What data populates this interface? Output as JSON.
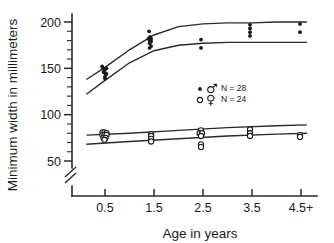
{
  "chart_data": {
    "type": "scatter",
    "title": "",
    "xlabel": "Age in years",
    "ylabel": "Minimum width in millimeters",
    "xlim": [
      0.0,
      5.0
    ],
    "ylim": [
      40,
      205
    ],
    "y_axis_break": true,
    "y_break_below": 45,
    "grid": false,
    "legend_position": "center-right",
    "x_tick_labels": [
      "0.5",
      "1.5",
      "2.5",
      "3.5",
      "4.5+"
    ],
    "x_tick_values": [
      0.5,
      1.5,
      2.5,
      3.5,
      4.5
    ],
    "y_tick_labels": [
      "200",
      "150",
      "100",
      "50"
    ],
    "y_tick_values": [
      200,
      150,
      100,
      50
    ],
    "y_minor_step": 10,
    "legend": [
      {
        "symbol": "♂",
        "marker": "filled-dot",
        "label": "N = 28"
      },
      {
        "symbol": "♀",
        "marker": "open-circle",
        "label": "N = 24"
      }
    ],
    "series": [
      {
        "name": "male",
        "marker": "filled-dot",
        "n": 28,
        "points": [
          {
            "x": 0.44,
            "y": 152
          },
          {
            "x": 0.47,
            "y": 150
          },
          {
            "x": 0.5,
            "y": 149
          },
          {
            "x": 0.53,
            "y": 150
          },
          {
            "x": 0.47,
            "y": 146
          },
          {
            "x": 0.5,
            "y": 145
          },
          {
            "x": 0.53,
            "y": 144
          },
          {
            "x": 0.5,
            "y": 141
          },
          {
            "x": 0.5,
            "y": 139
          },
          {
            "x": 1.4,
            "y": 190
          },
          {
            "x": 1.42,
            "y": 184
          },
          {
            "x": 1.39,
            "y": 182
          },
          {
            "x": 1.44,
            "y": 182
          },
          {
            "x": 1.41,
            "y": 180
          },
          {
            "x": 1.44,
            "y": 179
          },
          {
            "x": 1.41,
            "y": 177
          },
          {
            "x": 1.44,
            "y": 174
          },
          {
            "x": 1.41,
            "y": 172
          },
          {
            "x": 2.46,
            "y": 181
          },
          {
            "x": 2.46,
            "y": 172
          },
          {
            "x": 3.46,
            "y": 197
          },
          {
            "x": 3.46,
            "y": 193
          },
          {
            "x": 3.46,
            "y": 189
          },
          {
            "x": 3.46,
            "y": 185
          },
          {
            "x": 4.48,
            "y": 198
          },
          {
            "x": 4.48,
            "y": 189
          }
        ],
        "fit_upper": [
          {
            "x": 0.12,
            "y": 138
          },
          {
            "x": 0.5,
            "y": 151
          },
          {
            "x": 1.0,
            "y": 170
          },
          {
            "x": 1.5,
            "y": 186
          },
          {
            "x": 2.0,
            "y": 195
          },
          {
            "x": 2.5,
            "y": 198
          },
          {
            "x": 3.0,
            "y": 199
          },
          {
            "x": 3.5,
            "y": 199
          },
          {
            "x": 4.0,
            "y": 200
          },
          {
            "x": 4.62,
            "y": 200
          }
        ],
        "fit_lower": [
          {
            "x": 0.12,
            "y": 122
          },
          {
            "x": 0.5,
            "y": 137
          },
          {
            "x": 1.0,
            "y": 156
          },
          {
            "x": 1.5,
            "y": 169
          },
          {
            "x": 2.0,
            "y": 175
          },
          {
            "x": 2.5,
            "y": 177
          },
          {
            "x": 3.0,
            "y": 178
          },
          {
            "x": 3.5,
            "y": 178
          },
          {
            "x": 4.0,
            "y": 178
          },
          {
            "x": 4.62,
            "y": 178
          }
        ]
      },
      {
        "name": "female",
        "marker": "open-circle",
        "n": 24,
        "points": [
          {
            "x": 0.45,
            "y": 81
          },
          {
            "x": 0.49,
            "y": 81
          },
          {
            "x": 0.53,
            "y": 80
          },
          {
            "x": 0.45,
            "y": 78
          },
          {
            "x": 0.49,
            "y": 78
          },
          {
            "x": 0.53,
            "y": 78
          },
          {
            "x": 0.47,
            "y": 75
          },
          {
            "x": 0.51,
            "y": 75
          },
          {
            "x": 0.49,
            "y": 73
          },
          {
            "x": 1.44,
            "y": 79
          },
          {
            "x": 1.44,
            "y": 77
          },
          {
            "x": 1.44,
            "y": 74
          },
          {
            "x": 1.44,
            "y": 71
          },
          {
            "x": 2.46,
            "y": 83
          },
          {
            "x": 2.43,
            "y": 80
          },
          {
            "x": 2.48,
            "y": 80
          },
          {
            "x": 2.46,
            "y": 77
          },
          {
            "x": 2.46,
            "y": 68
          },
          {
            "x": 2.46,
            "y": 65
          },
          {
            "x": 3.46,
            "y": 84
          },
          {
            "x": 3.46,
            "y": 80
          },
          {
            "x": 3.46,
            "y": 77
          },
          {
            "x": 4.48,
            "y": 78
          },
          {
            "x": 4.48,
            "y": 76
          }
        ],
        "fit_upper": [
          {
            "x": 0.12,
            "y": 78
          },
          {
            "x": 1.0,
            "y": 80
          },
          {
            "x": 2.0,
            "y": 83
          },
          {
            "x": 3.0,
            "y": 86
          },
          {
            "x": 4.0,
            "y": 88
          },
          {
            "x": 4.62,
            "y": 89
          }
        ],
        "fit_lower": [
          {
            "x": 0.12,
            "y": 68
          },
          {
            "x": 1.0,
            "y": 71
          },
          {
            "x": 2.0,
            "y": 74
          },
          {
            "x": 3.0,
            "y": 77
          },
          {
            "x": 4.0,
            "y": 79
          },
          {
            "x": 4.62,
            "y": 80
          }
        ]
      }
    ]
  }
}
